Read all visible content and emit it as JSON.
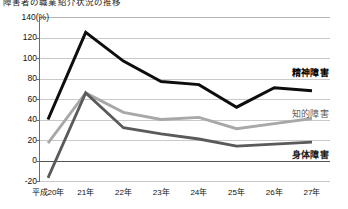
{
  "title": "障害者の職業紹介状況の推移",
  "axes": {
    "y_unit_label": "140(%)",
    "y_ticks": [
      "140",
      "120",
      "100",
      "80",
      "60",
      "40",
      "20",
      "0",
      "-20"
    ],
    "y_values": [
      140,
      120,
      100,
      80,
      60,
      40,
      20,
      0,
      -20
    ],
    "x_ticks": [
      "平成20年",
      "21年",
      "22年",
      "23年",
      "24年",
      "25年",
      "26年",
      "27年"
    ]
  },
  "legend": {
    "mental": "精神障害",
    "intellectual": "知的障害",
    "physical": "身体障害"
  },
  "colors": {
    "mental": "#0d0d0d",
    "intellectual": "#a8a8a8",
    "physical": "#5a5a5a",
    "grid": "#c9c9c9",
    "axis": "#6e6c68"
  },
  "chart_data": {
    "type": "line",
    "title": "障害者の職業紹介状況の推移",
    "xlabel": "",
    "ylabel": "(%)",
    "categories": [
      "平成20年",
      "21年",
      "22年",
      "23年",
      "24年",
      "25年",
      "26年",
      "27年"
    ],
    "ylim": [
      -20,
      140
    ],
    "ytick_step": 20,
    "grid": true,
    "legend_position": "right",
    "series": [
      {
        "name": "精神障害",
        "color": "#0d0d0d",
        "values": [
          40,
          125,
          97,
          77,
          74,
          52,
          71,
          68
        ]
      },
      {
        "name": "知的障害",
        "color": "#a8a8a8",
        "values": [
          17,
          66,
          47,
          40,
          42,
          31,
          36,
          41
        ]
      },
      {
        "name": "身体障害",
        "color": "#5a5a5a",
        "values": [
          -17,
          66,
          32,
          26,
          21,
          14,
          16,
          18
        ]
      }
    ]
  }
}
